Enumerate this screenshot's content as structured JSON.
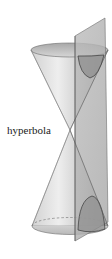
{
  "figure": {
    "labels": {
      "hyperbola": "hyperbola"
    },
    "colors": {
      "cone_light": "#e6e6e6",
      "cone_mid": "#c4c4c4",
      "cone_dark": "#9a9a9a",
      "plane": "#b4b4b4",
      "plane_edge": "#6e6e6e",
      "curve": "#3a3a3a",
      "inside_shade": "#8f8f8f"
    }
  }
}
